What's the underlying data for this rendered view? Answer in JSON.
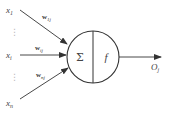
{
  "diagram": {
    "inputs": [
      {
        "label": "x",
        "sub": "1",
        "weight": "w",
        "weight_sub": "1j"
      },
      {
        "label": "x",
        "sub": "i",
        "weight": "w",
        "weight_sub": "ij"
      },
      {
        "label": "x",
        "sub": "n",
        "weight": "w",
        "weight_sub": "nj"
      }
    ],
    "ellipsis": "⋮",
    "neuron": {
      "sum_symbol": "Σ",
      "activation_symbol": "f"
    },
    "output": {
      "label": "O",
      "sub": "j"
    },
    "colors": {
      "stroke": "#333333",
      "text": "#444444",
      "background": "#ffffff"
    }
  }
}
